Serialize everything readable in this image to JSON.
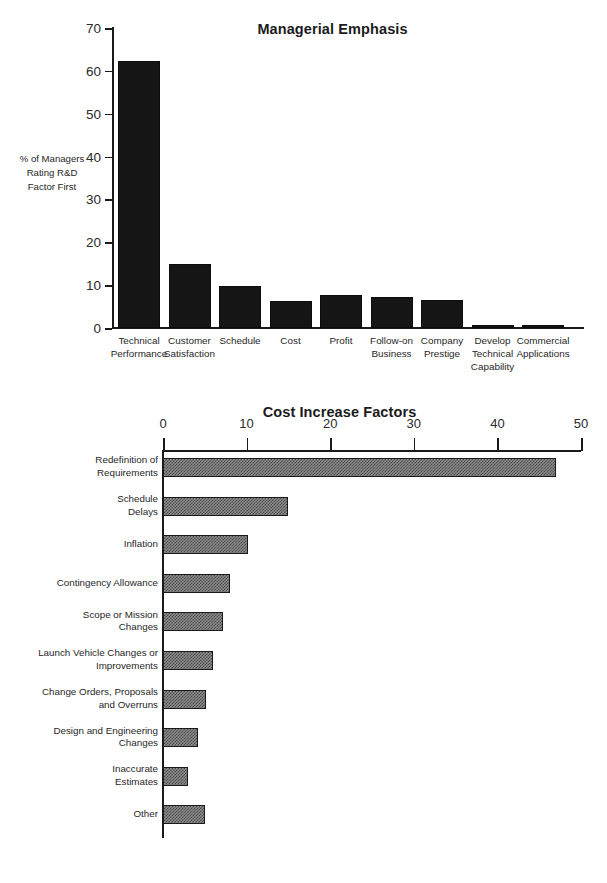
{
  "figure": {
    "background": "#ffffff",
    "ink_color": "#1a1a1a"
  },
  "chart_data": [
    {
      "type": "bar",
      "title": "Managerial Emphasis",
      "orientation": "vertical",
      "xlabel": "",
      "ylabel": "% of Managers\nRating R&D\nFactor First",
      "ylabel_lines": [
        "% of Managers",
        "Rating R&D",
        "Factor First"
      ],
      "ylim": [
        0,
        70
      ],
      "yticks": [
        0,
        10,
        20,
        30,
        40,
        50,
        60,
        70
      ],
      "ytick_labels": [
        "0",
        "10",
        "20",
        "30",
        "40",
        "50",
        "60",
        "70"
      ],
      "grid": false,
      "legend": "none",
      "bar_color": "#151515",
      "categories": [
        "Technical Performance",
        "Customer Satisfaction",
        "Schedule",
        "Cost",
        "Profit",
        "Follow-on Business",
        "Company Prestige",
        "Develop Technical Capability",
        "Commercial Applications"
      ],
      "category_label_lines": [
        [
          "Technical",
          "Performance"
        ],
        [
          "Customer",
          "Satisfaction"
        ],
        [
          "Schedule"
        ],
        [
          "Cost"
        ],
        [
          "Profit"
        ],
        [
          "Follow-on",
          "Business"
        ],
        [
          "Company",
          "Prestige"
        ],
        [
          "Develop",
          "Technical",
          "Capability"
        ],
        [
          "Commercial",
          "Applications"
        ]
      ],
      "values": [
        62.2,
        15.0,
        9.8,
        6.2,
        7.8,
        7.2,
        6.6,
        0.6,
        0.6
      ]
    },
    {
      "type": "bar",
      "title": "Cost Increase Factors",
      "orientation": "horizontal",
      "xlabel": "",
      "ylabel": "",
      "xlim": [
        0,
        50
      ],
      "xticks": [
        0,
        10,
        20,
        30,
        40,
        50
      ],
      "xtick_labels": [
        "0",
        "10",
        "20",
        "30",
        "40",
        "50"
      ],
      "xaxis_position": "top",
      "grid": false,
      "legend": "none",
      "bar_fill": "checkered-gray",
      "bar_color": "#8d8d8d",
      "categories": [
        "Redefinition of Requirements",
        "Schedule Delays",
        "Inflation",
        "Contingency Allowance",
        "Scope or Mission Changes",
        "Launch Vehicle Changes or Improvements",
        "Change Orders, Proposals and Overruns",
        "Design and Engineering Changes",
        "Inaccurate Estimates",
        "Other"
      ],
      "category_label_lines": [
        [
          "Redefinition of",
          "Requirements"
        ],
        [
          "Schedule",
          "Delays"
        ],
        [
          "Inflation"
        ],
        [
          "Contingency Allowance"
        ],
        [
          "Scope or Mission",
          "Changes"
        ],
        [
          "Launch Vehicle Changes or",
          "Improvements"
        ],
        [
          "Change Orders, Proposals",
          "and Overruns"
        ],
        [
          "Design and Engineering",
          "Changes"
        ],
        [
          "Inaccurate",
          "Estimates"
        ],
        [
          "Other"
        ]
      ],
      "values": [
        47.0,
        15.0,
        10.2,
        8.0,
        7.2,
        6.0,
        5.2,
        4.2,
        3.0,
        5.0
      ]
    }
  ]
}
